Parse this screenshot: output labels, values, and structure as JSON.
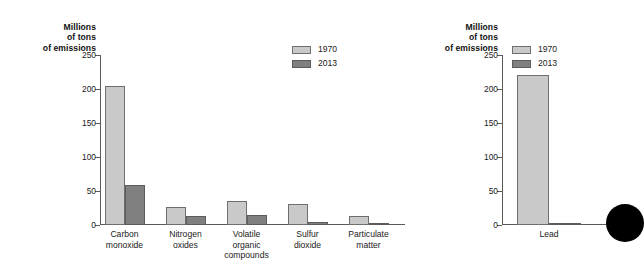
{
  "chart_data": [
    {
      "type": "bar",
      "title": "",
      "panel_name": "criteria-pollutants",
      "xlabel": "",
      "ylabel": "Millions of tons of emissions",
      "ylim": [
        0,
        250
      ],
      "yticks": [
        0,
        50,
        100,
        150,
        200,
        250
      ],
      "ytick_labels": [
        "0",
        "50",
        "100",
        "150",
        "200",
        "250"
      ],
      "grid": false,
      "legend_position": "top-right",
      "categories": [
        "Carbon\nmonoxide",
        "Nitrogen\noxides",
        "Volatile\norganic\ncompounds",
        "Sulfur\ndioxide",
        "Particulate\nmatter"
      ],
      "series": [
        {
          "name": "1970",
          "color": "#c9c9c9",
          "values": [
            204,
            27,
            35,
            31,
            13
          ]
        },
        {
          "name": "2013",
          "color": "#808080",
          "values": [
            59,
            13,
            14,
            5,
            1
          ]
        }
      ]
    },
    {
      "type": "bar",
      "title": "",
      "panel_name": "lead",
      "xlabel": "",
      "ylabel": "Millions of tons of emissions",
      "ylim": [
        0,
        250
      ],
      "yticks": [
        0,
        50,
        100,
        150,
        200,
        250
      ],
      "ytick_labels": [
        "0",
        "50",
        "100",
        "150",
        "200",
        "250"
      ],
      "grid": false,
      "legend_position": "top-right",
      "categories": [
        "Lead"
      ],
      "series": [
        {
          "name": "1970",
          "color": "#c9c9c9",
          "values": [
            221
          ]
        },
        {
          "name": "2013",
          "color": "#808080",
          "values": [
            1
          ]
        }
      ]
    }
  ],
  "left_panel": {
    "axis_title": "Millions\nof tons\nof emissions",
    "ticks": [
      "250",
      "200",
      "150",
      "100",
      "50",
      "0"
    ],
    "legend": [
      {
        "label": "1970"
      },
      {
        "label": "2013"
      }
    ],
    "categories": [
      {
        "label": "Carbon\nmonoxide"
      },
      {
        "label": "Nitrogen\noxides"
      },
      {
        "label": "Volatile\norganic\ncompounds"
      },
      {
        "label": "Sulfur\ndioxide"
      },
      {
        "label": "Particulate\nmatter"
      }
    ]
  },
  "right_panel": {
    "axis_title": "Millions\nof tons\nof emissions",
    "ticks": [
      "250",
      "200",
      "150",
      "100",
      "50",
      "0"
    ],
    "legend": [
      {
        "label": "1970"
      },
      {
        "label": "2013"
      }
    ],
    "categories": [
      {
        "label": "Lead"
      }
    ]
  },
  "colors": {
    "series_1970": "#c9c9c9",
    "series_2013": "#808080",
    "axis": "#5a5a5a",
    "text": "#1a1a1a",
    "dot": "#000000",
    "background": "#ffffff"
  }
}
